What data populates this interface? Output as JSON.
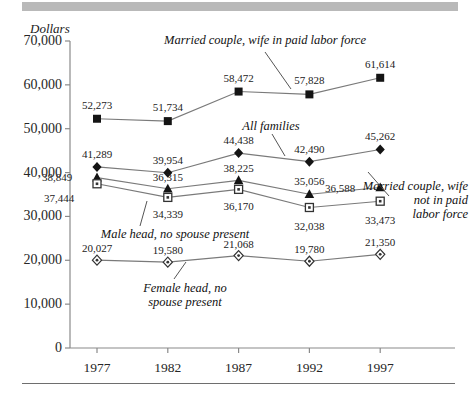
{
  "figure": {
    "y_axis_title": "Dollars",
    "y_ticks": [
      "70,000",
      "60,000",
      "50,000",
      "40,000",
      "30,000",
      "20,000",
      "10,000",
      "0"
    ],
    "x_ticks": [
      "1977",
      "1982",
      "1987",
      "1992",
      "1997"
    ]
  },
  "annotations": {
    "married_wife_paid": "Married couple, wife in paid labor force",
    "all_families": "All families",
    "married_wife_not_paid_l1": "Married couple, wife",
    "married_wife_not_paid_l2": "not in paid",
    "married_wife_not_paid_l3": "labor force",
    "male_head": "Male head, no spouse present",
    "female_head_l1": "Female head, no",
    "female_head_l2": "spouse present"
  },
  "colors": {
    "band": "#b9b9b9",
    "rule": "#6e6e6e",
    "axis": "#8a8a8a",
    "series_line": "#7a7a7a",
    "marker_fill": "#141414",
    "marker_open": "#ffffff",
    "text": "#1a1a1a"
  },
  "chart_data": {
    "type": "line",
    "title": "",
    "subtitle": "",
    "xlabel": "",
    "ylabel": "Dollars",
    "x": [
      1977,
      1982,
      1987,
      1992,
      1997
    ],
    "categories": [
      "1977",
      "1982",
      "1987",
      "1992",
      "1997"
    ],
    "ylim": [
      0,
      70000
    ],
    "ytick_values": [
      0,
      10000,
      20000,
      30000,
      40000,
      50000,
      60000,
      70000
    ],
    "grid": false,
    "legend": "annotated-inline",
    "series": [
      {
        "name": "Married couple, wife in paid labor force",
        "marker": "filled-square",
        "values": [
          52273,
          51734,
          58472,
          57828,
          61614
        ],
        "labels": [
          "52,273",
          "51,734",
          "58,472",
          "57,828",
          "61,614"
        ]
      },
      {
        "name": "All families",
        "marker": "filled-diamond",
        "values": [
          41289,
          39954,
          44438,
          42490,
          45262
        ],
        "labels": [
          "41,289",
          "39,954",
          "44,438",
          "42,490",
          "45,262"
        ]
      },
      {
        "name": "Married couple, wife not in paid labor force",
        "marker": "filled-triangle",
        "values": [
          38849,
          36315,
          38225,
          35056,
          36588
        ],
        "labels": [
          "38,849",
          "36,315",
          "38,225",
          "35,056",
          "36,588"
        ]
      },
      {
        "name": "Male head, no spouse present",
        "marker": "open-square",
        "values": [
          37444,
          34339,
          36170,
          32038,
          33473
        ],
        "labels": [
          "37,444",
          "34,339",
          "36,170",
          "32,038",
          "33,473"
        ]
      },
      {
        "name": "Female head, no spouse present",
        "marker": "open-diamond",
        "values": [
          20027,
          19580,
          21068,
          19780,
          21350
        ],
        "labels": [
          "20,027",
          "19,580",
          "21,068",
          "19,780",
          "21,350"
        ]
      }
    ]
  }
}
